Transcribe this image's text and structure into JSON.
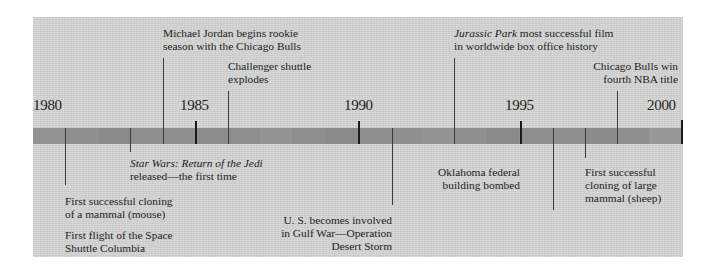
{
  "timeline": {
    "start_year": 1980,
    "end_year": 2000,
    "colors": {
      "panel": "#d5d5d5",
      "bar": "#8f8f8f",
      "bar_dark_segment": "#858585",
      "bar_light_segment": "#9a9a9a",
      "tick": "#1a1a1a",
      "text": "#222222"
    },
    "year_labels": [
      {
        "year": 1980,
        "label": "1980"
      },
      {
        "year": 1985,
        "label": "1985"
      },
      {
        "year": 1990,
        "label": "1990"
      },
      {
        "year": 1995,
        "label": "1995"
      },
      {
        "year": 2000,
        "label": "2000"
      }
    ],
    "events_above": [
      {
        "year": 1984,
        "text_line1": "Michael Jordan begins rookie",
        "text_line2": "season with the Chicago Bulls"
      },
      {
        "year": 1986,
        "text_line1": "Challenger shuttle",
        "text_line2": "explodes"
      },
      {
        "year": 1993,
        "title_italic": "Jurassic Park",
        "text_line1_rest": " most successful  film",
        "text_line2": "in worldwide box office history"
      },
      {
        "year": 1998,
        "text_line1": "Chicago Bulls win",
        "text_line2": "fourth NBA title"
      }
    ],
    "events_below": [
      {
        "year": 1981,
        "entries": [
          {
            "text_line1": "First successful cloning",
            "text_line2": "of a mammal (mouse)"
          },
          {
            "text_line1": "First flight of the Space",
            "text_line2": "Shuttle Columbia"
          }
        ]
      },
      {
        "year": 1983,
        "title_italic": "Star Wars: Return of the Jedi",
        "text_line2": "released—the first time"
      },
      {
        "year": 1991,
        "text_line1": "U. S. becomes involved",
        "text_line2": "in Gulf War—Operation",
        "text_line3": "Desert Storm"
      },
      {
        "year": 1995,
        "text_line1": "Oklahoma federal",
        "text_line2": "building bombed"
      },
      {
        "year": 1997,
        "text_line1": "First successful",
        "text_line2": "cloning of large",
        "text_line3": "mammal (sheep)"
      }
    ]
  }
}
